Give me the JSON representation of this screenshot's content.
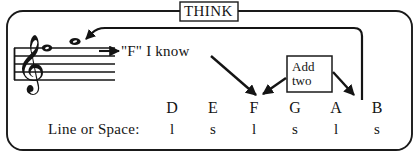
{
  "diagram": {
    "title": "THINK",
    "known_note_label": "\"F\" I know",
    "add_two_box": {
      "line1": "Add",
      "line2": "two"
    },
    "line_or_space_label": "Line or Space:",
    "scale": {
      "letters": [
        "D",
        "E",
        "F",
        "G",
        "A",
        "B"
      ],
      "line_or_space": [
        "l",
        "s",
        "l",
        "s",
        "l",
        "s"
      ],
      "x_positions": [
        172,
        213,
        254,
        295,
        336,
        377
      ]
    },
    "staff": {
      "clef": "treble-clef",
      "note_count": 2,
      "notes": [
        {
          "name": "note-on-top-line",
          "x": 47,
          "y": 48
        },
        {
          "name": "note-in-space-above",
          "x": 75,
          "y": 42
        }
      ]
    },
    "colors": {
      "ink": "#141414",
      "background": "#ffffff",
      "border": "#1a1a1a"
    }
  }
}
